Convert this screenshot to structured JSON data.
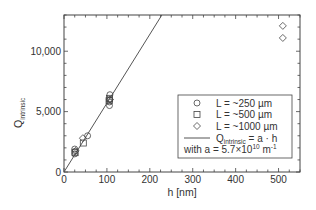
{
  "chart_data": {
    "type": "scatter",
    "title": "",
    "xlabel": "h [nm]",
    "ylabel": "Q",
    "ylabel_subscript": "intrinsic",
    "xlim": [
      0,
      550
    ],
    "ylim": [
      0,
      13000
    ],
    "x_ticks": [
      0,
      100,
      200,
      300,
      400,
      500
    ],
    "x_tick_labels": [
      "0",
      "100",
      "200",
      "300",
      "400",
      "500"
    ],
    "x_minor_step": 25,
    "y_ticks": [
      0,
      5000,
      10000
    ],
    "y_tick_labels": [
      "0",
      "5,000",
      "10,000"
    ],
    "y_minor_step": 1000,
    "grid": false,
    "legend_position": "center-right",
    "series": [
      {
        "name": "L = ~250 µm",
        "marker": "circle",
        "points": [
          [
            25,
            1500
          ],
          [
            25,
            1700
          ],
          [
            25,
            1900
          ],
          [
            55,
            3000
          ],
          [
            106,
            5500
          ],
          [
            106,
            5800
          ],
          [
            107,
            6000
          ],
          [
            107,
            6400
          ]
        ]
      },
      {
        "name": "L = ~500 µm",
        "marker": "square",
        "points": [
          [
            26,
            1600
          ],
          [
            45,
            2400
          ],
          [
            105,
            5900
          ],
          [
            106,
            6100
          ]
        ]
      },
      {
        "name": "L = ~1000 µm",
        "marker": "diamond",
        "points": [
          [
            27,
            1750
          ],
          [
            44,
            2800
          ],
          [
            107,
            6000
          ],
          [
            510,
            11100
          ],
          [
            510,
            12100
          ]
        ]
      },
      {
        "name": "Q_intrinsic = a · h",
        "type": "line",
        "slope_per_nm": 57,
        "x": [
          0,
          230
        ],
        "y": [
          0,
          13110
        ]
      }
    ],
    "legend": [
      {
        "marker": "circle",
        "label": "L = ~250 µm"
      },
      {
        "marker": "square",
        "label": "L = ~500 µm"
      },
      {
        "marker": "diamond",
        "label": "L = ~1000 µm"
      },
      {
        "marker": "line",
        "label_main": "Q",
        "label_sub": "intrinsic",
        "label_rest": " = a · h"
      }
    ],
    "legend_note": {
      "prefix": "with a = 5.7×10",
      "exponent": "10",
      "suffix": " m",
      "suffix_exp": "-1"
    }
  }
}
